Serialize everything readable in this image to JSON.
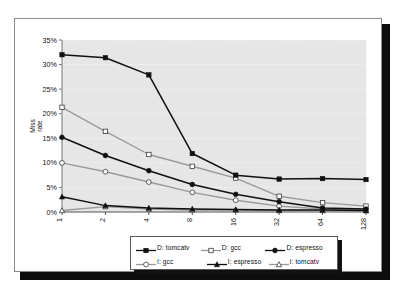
{
  "figure": {
    "frame_name": "scanned-figure-frame",
    "background": "#ffffff",
    "plot_background": "#e6e6e6"
  },
  "chart_data": {
    "type": "line",
    "title": "",
    "subtitle": "",
    "xlabel": "Cache size (KB)",
    "ylabel": "Miss rate",
    "categories": [
      "1",
      "2",
      "4",
      "8",
      "16",
      "32",
      "64",
      "128"
    ],
    "x_tick_labels": [
      "1",
      "2",
      "4",
      "8",
      "16",
      "32",
      "64",
      "128"
    ],
    "x_tick_rotation": "90",
    "y_tick_labels": [
      "0%",
      "5%",
      "10%",
      "15%",
      "20%",
      "25%",
      "30%",
      "35%"
    ],
    "y_tick_values": [
      0,
      5,
      10,
      15,
      20,
      25,
      30,
      35
    ],
    "ylim": [
      0,
      35
    ],
    "y_unit": "%",
    "grid": "horizontal-dotted",
    "legend_position": "below-plot",
    "series": [
      {
        "name": "D: tomcatv",
        "marker": "filled-square",
        "color": "#101010",
        "values": [
          32.0,
          31.4,
          27.9,
          11.9,
          7.5,
          6.7,
          6.8,
          6.6
        ]
      },
      {
        "name": "D: gcc",
        "marker": "open-square",
        "color": "#9a9a9a",
        "values": [
          21.3,
          16.4,
          11.7,
          9.3,
          6.9,
          3.2,
          1.9,
          1.2
        ]
      },
      {
        "name": "D: espresso",
        "marker": "filled-circle",
        "color": "#101010",
        "values": [
          15.2,
          11.5,
          8.4,
          5.6,
          3.6,
          2.1,
          0.8,
          0.6
        ]
      },
      {
        "name": "I: gcc",
        "marker": "open-circle",
        "color": "#9a9a9a",
        "values": [
          10.0,
          8.2,
          6.1,
          4.0,
          2.4,
          1.2,
          0.6,
          0.4
        ]
      },
      {
        "name": "I: espresso",
        "marker": "filled-triangle",
        "color": "#101010",
        "values": [
          3.1,
          1.3,
          0.8,
          0.6,
          0.5,
          0.4,
          0.4,
          0.3
        ]
      },
      {
        "name": "I: tomcatv",
        "marker": "open-triangle",
        "color": "#9a9a9a",
        "values": [
          0.3,
          1.1,
          0.6,
          0.4,
          0.4,
          0.3,
          0.3,
          0.3
        ]
      }
    ]
  },
  "legend": {
    "rows": [
      [
        {
          "label": "D: tomcatv",
          "marker": "filled-square",
          "color": "#101010"
        },
        {
          "label": "D: gcc",
          "marker": "open-square",
          "color": "#9a9a9a"
        },
        {
          "label": "D: espresso",
          "marker": "filled-circle",
          "color": "#101010"
        }
      ],
      [
        {
          "label": "I: gcc",
          "marker": "open-circle",
          "color": "#9a9a9a"
        },
        {
          "label": "I: espresso",
          "marker": "filled-triangle",
          "color": "#101010"
        },
        {
          "label": "I: tomcatv",
          "marker": "open-triangle",
          "color": "#9a9a9a"
        }
      ]
    ]
  }
}
